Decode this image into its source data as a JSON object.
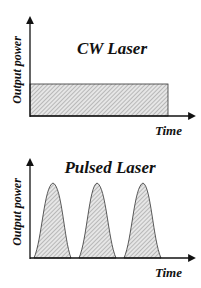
{
  "diagrams": [
    {
      "title": "CW Laser",
      "ylabel": "Output power",
      "xlabel": "Time",
      "shape": "constant-rectangle"
    },
    {
      "title": "Pulsed Laser",
      "ylabel": "Output power",
      "xlabel": "Time",
      "shape": "pulses",
      "pulse_count": 3
    }
  ]
}
